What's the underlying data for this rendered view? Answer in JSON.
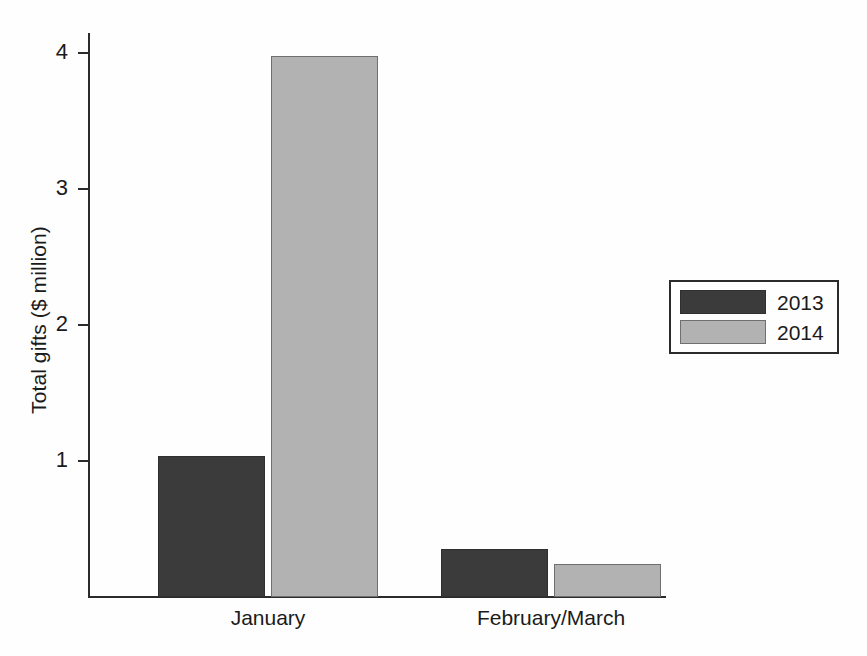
{
  "chart_data": {
    "type": "bar",
    "title": "",
    "subtitle": "",
    "xlabel": "",
    "ylabel": "Total gifts ($ million)",
    "categories": [
      "January",
      "February/March"
    ],
    "series": [
      {
        "name": "2013",
        "color": "#3b3b3b",
        "values": [
          1.04,
          0.35
        ]
      },
      {
        "name": "2014",
        "color": "#b2b2b2",
        "values": [
          3.98,
          0.24
        ]
      }
    ],
    "ylim": [
      0,
      4.15
    ],
    "yticks": [
      1,
      2,
      3,
      4
    ],
    "ytick_labels": [
      "1",
      "2",
      "3",
      "4"
    ],
    "grid": false,
    "legend_position": "right"
  },
  "axes": {
    "y_title": "Total gifts ($ million)",
    "y_tick_labels": [
      "4",
      "3",
      "2",
      "1"
    ],
    "x_tick_labels": [
      "January",
      "February/March"
    ]
  },
  "legend": {
    "entries": [
      {
        "label": "2013",
        "color": "#3b3b3b"
      },
      {
        "label": "2014",
        "color": "#b2b2b2"
      }
    ]
  }
}
